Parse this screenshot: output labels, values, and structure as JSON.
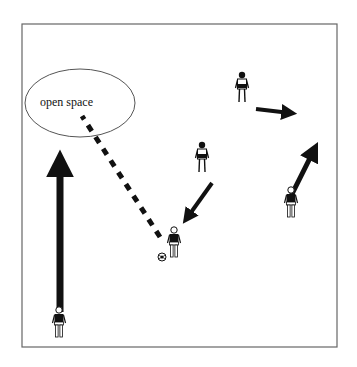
{
  "diagram": {
    "title": "",
    "zone_label": "open space",
    "field": {
      "x": 22,
      "y": 24,
      "width": 315,
      "height": 323,
      "stroke": "#555555"
    },
    "zone": {
      "cx": 80,
      "cy": 103,
      "rx": 55,
      "ry": 34,
      "label_x": 70,
      "label_y": 103
    },
    "colors": {
      "ink": "#111111",
      "border": "#666666"
    },
    "players": [
      {
        "id": "player-top-right",
        "x": 242,
        "y": 90
      },
      {
        "id": "player-middle",
        "x": 202,
        "y": 160
      },
      {
        "id": "player-with-ball",
        "x": 174,
        "y": 245
      },
      {
        "id": "player-right",
        "x": 291,
        "y": 205
      },
      {
        "id": "player-bottom-left",
        "x": 59,
        "y": 325
      }
    ],
    "ball": {
      "x": 162,
      "y": 257
    },
    "pass_line": {
      "type": "dashed",
      "from": [
        160,
        237
      ],
      "to": [
        82,
        116
      ]
    },
    "run_arrows": [
      {
        "id": "run-long-left",
        "from": [
          60,
          312
        ],
        "to": [
          60,
          150
        ],
        "width": 7
      },
      {
        "id": "run-top-right",
        "from": [
          256,
          109
        ],
        "to": [
          297,
          114
        ],
        "width": 4
      },
      {
        "id": "run-middle-to-ball",
        "from": [
          212,
          183
        ],
        "to": [
          183,
          225
        ],
        "width": 4
      },
      {
        "id": "run-right-up",
        "from": [
          290,
          198
        ],
        "to": [
          318,
          142
        ],
        "width": 5
      }
    ]
  }
}
